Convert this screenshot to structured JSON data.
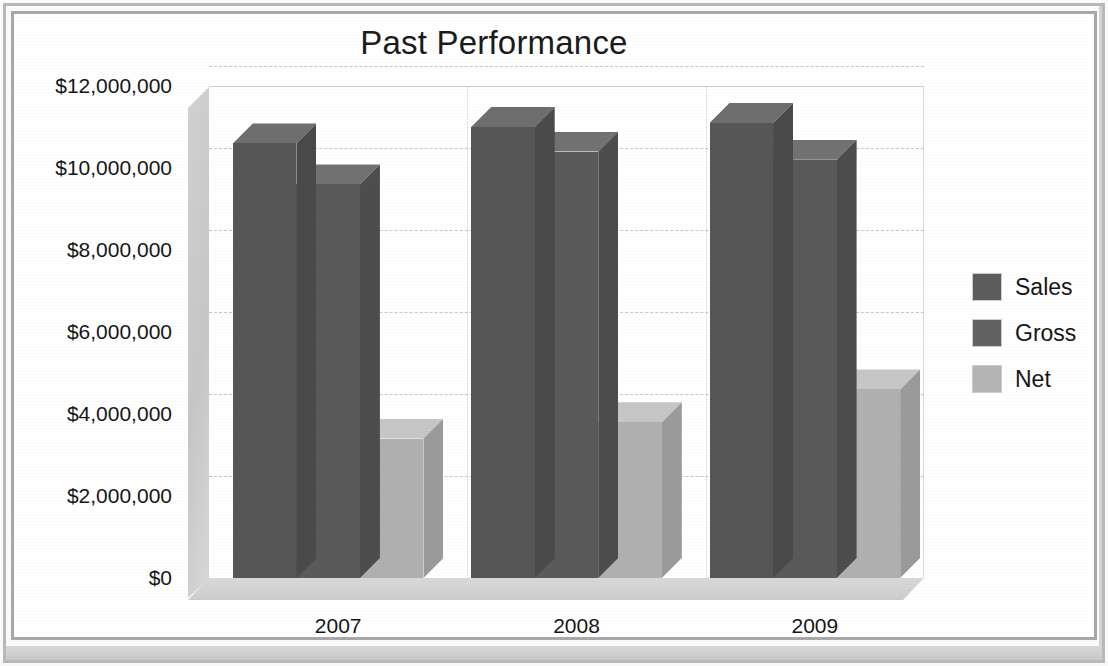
{
  "document": {
    "frame_color": "#b9b9b9"
  },
  "chart_data": {
    "type": "bar",
    "title": "Past Performance",
    "subtitle": "",
    "xlabel": "",
    "ylabel": "",
    "categories": [
      "2007",
      "2008",
      "2009"
    ],
    "series": [
      {
        "name": "Sales",
        "color": "#5d5d5d",
        "values": [
          10600000,
          11000000,
          11100000
        ]
      },
      {
        "name": "Gross",
        "color": "#626262",
        "values": [
          9600000,
          10400000,
          10200000
        ]
      },
      {
        "name": "Net",
        "color": "#b4b4b4",
        "values": [
          3400000,
          3800000,
          4600000
        ]
      }
    ],
    "ylim": [
      0,
      12000000
    ],
    "ytick_values": [
      0,
      2000000,
      4000000,
      6000000,
      8000000,
      10000000,
      12000000
    ],
    "ytick_labels": [
      "$0",
      "$2,000,000",
      "$4,000,000",
      "$6,000,000",
      "$8,000,000",
      "$10,000,000",
      "$12,000,000"
    ],
    "grid": true,
    "grid_style": "dashed-horizontal",
    "legend_position": "right",
    "three_d": true
  }
}
